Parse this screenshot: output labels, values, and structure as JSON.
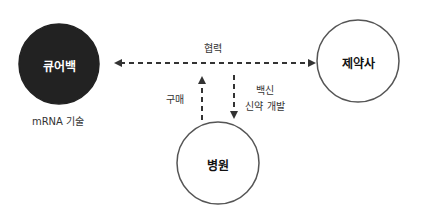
{
  "diagram": {
    "nodes": [
      {
        "id": "curevac",
        "label": "큐어백",
        "sublabel": "mRNA 기술",
        "fill": "#222222",
        "text_color": "#ffffff"
      },
      {
        "id": "pharma",
        "label": "제약사",
        "fill": "#ffffff",
        "text_color": "#111111"
      },
      {
        "id": "hospital",
        "label": "병원",
        "fill": "#ffffff",
        "text_color": "#111111"
      }
    ],
    "edges": [
      {
        "from": "curevac",
        "to": "pharma",
        "label": "협력",
        "style": "dashed",
        "direction": "both"
      },
      {
        "from": "hospital",
        "to": "curevac-pharma-link",
        "label": "구매",
        "style": "dashed",
        "direction": "up"
      },
      {
        "from": "curevac-pharma-link",
        "to": "hospital",
        "label_lines": [
          "백신",
          "신약 개발"
        ],
        "style": "dashed",
        "direction": "down"
      }
    ]
  }
}
